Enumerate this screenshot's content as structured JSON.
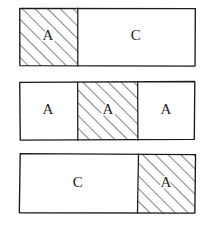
{
  "diagram": {
    "style": {
      "background_color": "#ffffff",
      "line_color": "#1a1a1a",
      "text_color": "#1d1d1d",
      "hatch_color": "#2a2a2a",
      "hatch_angle_degrees": 45,
      "hatch_spacing_px": 9
    },
    "canvas": {
      "width": 211,
      "height": 226
    },
    "rows": [
      {
        "id": "row-1",
        "x": 20,
        "y": 8,
        "width": 175,
        "height": 58,
        "cells": [
          {
            "label": "A",
            "fill": "hatched",
            "x": 20,
            "width": 58,
            "label_x": 48,
            "label_y": 37
          },
          {
            "label": "C",
            "fill": "plain",
            "x": 78,
            "width": 117,
            "label_x": 136,
            "label_y": 37
          }
        ]
      },
      {
        "id": "row-2",
        "x": 20,
        "y": 82,
        "width": 175,
        "height": 58,
        "cells": [
          {
            "label": "A",
            "fill": "plain",
            "x": 20,
            "width": 58,
            "label_x": 48,
            "label_y": 111
          },
          {
            "label": "A",
            "fill": "hatched",
            "x": 78,
            "width": 60,
            "label_x": 108,
            "label_y": 111
          },
          {
            "label": "A",
            "fill": "plain",
            "x": 138,
            "width": 57,
            "label_x": 166,
            "label_y": 111
          }
        ]
      },
      {
        "id": "row-3",
        "x": 20,
        "y": 154,
        "width": 175,
        "height": 59,
        "cells": [
          {
            "label": "C",
            "fill": "plain",
            "x": 20,
            "width": 118,
            "label_x": 78,
            "label_y": 184
          },
          {
            "label": "A",
            "fill": "hatched",
            "x": 138,
            "width": 57,
            "label_x": 166,
            "label_y": 184
          }
        ]
      }
    ]
  }
}
